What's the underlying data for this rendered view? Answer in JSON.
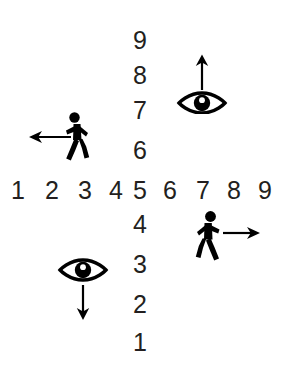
{
  "diagram": {
    "background_color": "#ffffff",
    "ink_color": "#231f20",
    "glyph_color": "#000000",
    "horizontal_axis": {
      "name": "horizontal-number-row",
      "labels": [
        "1",
        "2",
        "3",
        "4",
        "5",
        "6",
        "7",
        "8",
        "9"
      ],
      "x_positions": [
        16,
        52,
        88,
        122,
        140,
        176,
        210,
        238,
        266
      ],
      "y": 178
    },
    "vertical_axis": {
      "name": "vertical-number-column",
      "labels_above": [
        "9",
        "8",
        "7",
        "6"
      ],
      "labels_above_y": [
        28,
        63,
        98,
        138
      ],
      "labels_below": [
        "4",
        "3",
        "2",
        "1"
      ],
      "labels_below_y": [
        212,
        252,
        292,
        330
      ],
      "x": 140
    },
    "icons": [
      {
        "id": "upper-right",
        "eye": "eye-icon-up",
        "arrow": "arrow-up-icon",
        "arrow_direction": "up",
        "meaning": "looking up",
        "x": 175,
        "y": 52
      },
      {
        "id": "upper-left",
        "person": "walking-person-icon-left",
        "arrow": "arrow-left-icon",
        "arrow_direction": "left",
        "meaning": "walking left",
        "x": 26,
        "y": 110
      },
      {
        "id": "lower-right",
        "person": "walking-person-icon-right",
        "arrow": "arrow-right-icon",
        "arrow_direction": "right",
        "meaning": "walking right",
        "x": 183,
        "y": 208
      },
      {
        "id": "lower-left",
        "eye": "eye-icon-down",
        "arrow": "arrow-down-icon",
        "arrow_direction": "down",
        "meaning": "looking down",
        "x": 55,
        "y": 256
      }
    ]
  }
}
